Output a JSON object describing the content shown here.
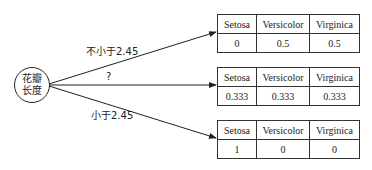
{
  "root_node": {
    "line1": "花瓣",
    "line2": "长度"
  },
  "edges": [
    {
      "label": "不小于2.45"
    },
    {
      "label": "?"
    },
    {
      "label": "小于2.45"
    }
  ],
  "columns": [
    "Setosa",
    "Versicolor",
    "Virginica"
  ],
  "leaves": [
    {
      "headers": [
        "Setosa",
        "Versicolor",
        "Virginica"
      ],
      "values": [
        "0",
        "0.5",
        "0.5"
      ]
    },
    {
      "headers": [
        "Setosa",
        "Versicolor",
        "Virginica"
      ],
      "values": [
        "0.333",
        "0.333",
        "0.333"
      ]
    },
    {
      "headers": [
        "Setosa",
        "Versicolor",
        "Virginica"
      ],
      "values": [
        "1",
        "0",
        "0"
      ]
    }
  ]
}
